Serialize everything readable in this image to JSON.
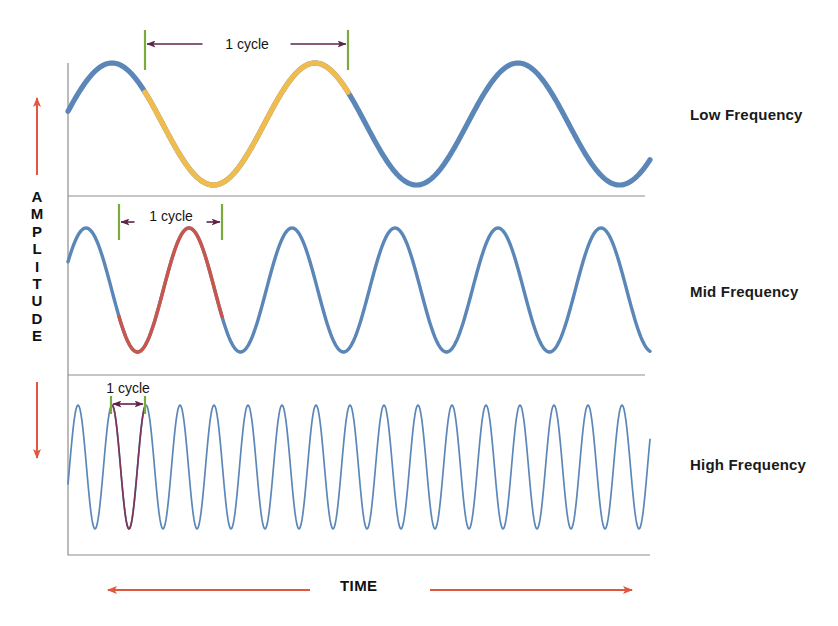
{
  "figure": {
    "background": "#ffffff",
    "axes": {
      "amplitude_label": "AMPLITUDE",
      "amplitude_letters": [
        "A",
        "M",
        "P",
        "L",
        "I",
        "T",
        "U",
        "D",
        "E"
      ],
      "time_label": "TIME",
      "axis_arrow_color": "#e0563f",
      "frame_color": "#8e8e8e"
    },
    "rows": [
      {
        "id": "low",
        "label": "Low Frequency",
        "cycle_annotation": "1 cycle",
        "cycle_label_position": "inline",
        "wave_color": "#5b87b8",
        "highlight_color": "#f0bc4e",
        "stroke_width": 5.2,
        "marker_color": "#7aa93c",
        "arrow_color": "#6b2a52"
      },
      {
        "id": "mid",
        "label": "Mid Frequency",
        "cycle_annotation": "1 cycle",
        "cycle_label_position": "inline",
        "wave_color": "#5b87b8",
        "highlight_color": "#c9564a",
        "stroke_width": 3.4,
        "marker_color": "#7aa93c",
        "arrow_color": "#4a1f3e"
      },
      {
        "id": "high",
        "label": "High Frequency",
        "cycle_annotation": "1 cycle",
        "cycle_label_position": "above",
        "wave_color": "#5b87b8",
        "highlight_color": "#7d3559",
        "stroke_width": 1.7,
        "marker_color": "#7aa93c",
        "arrow_color": "#4a1f3e"
      }
    ]
  },
  "chart_data": {
    "type": "line",
    "title": "",
    "xlabel": "TIME",
    "ylabel": "AMPLITUDE",
    "grid": false,
    "legend": "right-of-plot",
    "plot_area": {
      "x0": 68,
      "x1": 650,
      "y_top": 63,
      "y_bottom": 555
    },
    "panels": [
      {
        "name": "Low Frequency",
        "band": {
          "top": 63,
          "bottom": 196
        },
        "baseline_y": 124,
        "amplitude_px": 61,
        "cycles_visible": 2.85,
        "period_px": 203,
        "phase_offset_px": 44,
        "highlight_cycle": {
          "start_x": 145,
          "end_x": 348
        },
        "markers_x": [
          145,
          348
        ],
        "series_color": "#5b87b8",
        "highlight_color": "#f0bc4e"
      },
      {
        "name": "Mid Frequency",
        "band": {
          "top": 196,
          "bottom": 375
        },
        "baseline_y": 290,
        "amplitude_px": 62,
        "cycles_visible": 5.6,
        "period_px": 103,
        "phase_offset_px": 18,
        "highlight_cycle": {
          "start_x": 119,
          "end_x": 222
        },
        "markers_x": [
          119,
          222
        ],
        "series_color": "#5b87b8",
        "highlight_color": "#c9564a"
      },
      {
        "name": "High Frequency",
        "band": {
          "top": 375,
          "bottom": 555
        },
        "baseline_y": 467,
        "amplitude_px": 62,
        "cycles_visible": 17.0,
        "period_px": 34,
        "phase_offset_px": 10,
        "highlight_cycle": {
          "start_x": 111,
          "end_x": 145
        },
        "markers_x": [
          111,
          145
        ],
        "series_color": "#5b87b8",
        "highlight_color": "#7d3559"
      }
    ],
    "annotations": [
      {
        "text": "1 cycle",
        "panel": "Low Frequency",
        "x": 247,
        "y": 44
      },
      {
        "text": "1 cycle",
        "panel": "Mid Frequency",
        "x": 171,
        "y": 216
      },
      {
        "text": "1 cycle",
        "panel": "High Frequency",
        "x": 128,
        "y": 388
      }
    ]
  }
}
